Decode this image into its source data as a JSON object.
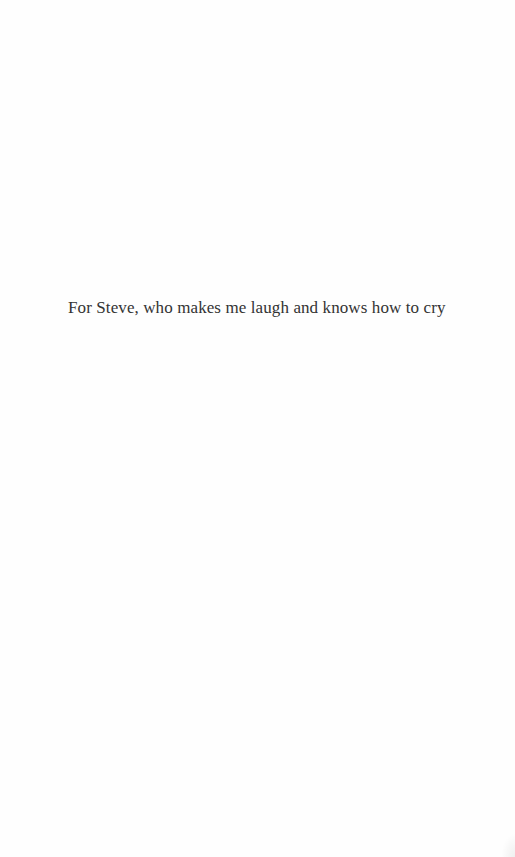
{
  "page": {
    "type": "dedication",
    "dedication_text": "For Steve, who makes me laugh and knows how to cry"
  },
  "colors": {
    "background": "#fefefe",
    "text": "#333333"
  }
}
